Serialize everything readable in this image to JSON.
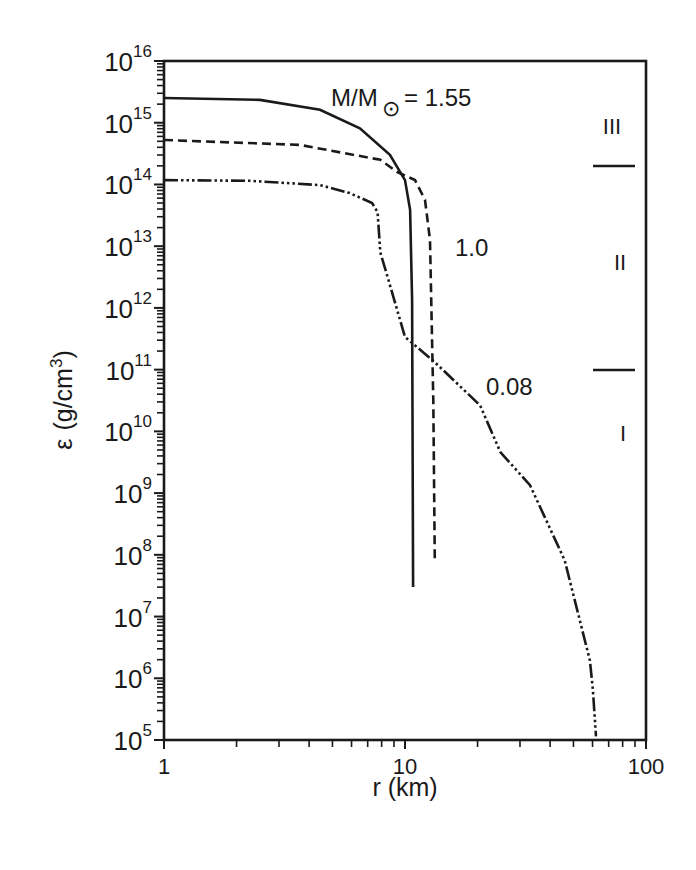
{
  "chart_data": {
    "type": "line",
    "title": "",
    "xlabel": "r (km)",
    "ylabel": "ε (g/cm3)",
    "xscale": "log",
    "yscale": "log",
    "xlim": [
      1,
      100
    ],
    "ylim": [
      100000.0,
      1e+16
    ],
    "x_ticks": [
      {
        "value": 1,
        "label": "1"
      },
      {
        "value": 10,
        "label": "10"
      },
      {
        "value": 100,
        "label": "100"
      }
    ],
    "y_ticks": [
      {
        "exp": 5,
        "base": "10",
        "label_exp": "5"
      },
      {
        "exp": 6,
        "base": "10",
        "label_exp": "6"
      },
      {
        "exp": 7,
        "base": "10",
        "label_exp": "7"
      },
      {
        "exp": 8,
        "base": "10",
        "label_exp": "8"
      },
      {
        "exp": 9,
        "base": "10",
        "label_exp": "9"
      },
      {
        "exp": 10,
        "base": "10",
        "label_exp": "10"
      },
      {
        "exp": 11,
        "base": "10",
        "label_exp": "11"
      },
      {
        "exp": 12,
        "base": "10",
        "label_exp": "12"
      },
      {
        "exp": 13,
        "base": "10",
        "label_exp": "13"
      },
      {
        "exp": 14,
        "base": "10",
        "label_exp": "14"
      },
      {
        "exp": 15,
        "base": "10",
        "label_exp": "15"
      },
      {
        "exp": 16,
        "base": "10",
        "label_exp": "16"
      }
    ],
    "grid": false,
    "legend": "none (curves labelled inline)",
    "series": [
      {
        "name": "M/M☉ = 1.55",
        "style": "solid",
        "points": [
          {
            "r": 1.0,
            "log_eps": 15.4
          },
          {
            "r": 2.5,
            "log_eps": 15.37
          },
          {
            "r": 4.44,
            "log_eps": 15.21
          },
          {
            "r": 6.5,
            "log_eps": 14.91
          },
          {
            "r": 8.66,
            "log_eps": 14.48
          },
          {
            "r": 10.0,
            "log_eps": 14.07
          },
          {
            "r": 10.5,
            "log_eps": 13.59
          },
          {
            "r": 10.7,
            "log_eps": 12.13
          },
          {
            "r": 10.8,
            "log_eps": 7.48
          }
        ]
      },
      {
        "name": "1.0",
        "style": "dashed",
        "points": [
          {
            "r": 1.0,
            "log_eps": 14.72
          },
          {
            "r": 3.66,
            "log_eps": 14.64
          },
          {
            "r": 7.9,
            "log_eps": 14.4
          },
          {
            "r": 9.3,
            "log_eps": 14.2
          },
          {
            "r": 11.0,
            "log_eps": 14.07
          },
          {
            "r": 12.1,
            "log_eps": 13.75
          },
          {
            "r": 12.7,
            "log_eps": 13.1
          },
          {
            "r": 13.1,
            "log_eps": 10.51
          },
          {
            "r": 13.3,
            "log_eps": 7.88
          }
        ]
      },
      {
        "name": "0.08",
        "style": "dash-dot-dot",
        "points": [
          {
            "r": 1.0,
            "log_eps": 14.07
          },
          {
            "r": 2.27,
            "log_eps": 14.06
          },
          {
            "r": 4.44,
            "log_eps": 13.99
          },
          {
            "r": 5.9,
            "log_eps": 13.86
          },
          {
            "r": 7.3,
            "log_eps": 13.7
          },
          {
            "r": 7.7,
            "log_eps": 13.55
          },
          {
            "r": 7.9,
            "log_eps": 12.9
          },
          {
            "r": 8.25,
            "log_eps": 12.65
          },
          {
            "r": 10.0,
            "log_eps": 11.53
          },
          {
            "r": 13.3,
            "log_eps": 11.12
          },
          {
            "r": 20.5,
            "log_eps": 10.42
          },
          {
            "r": 24.9,
            "log_eps": 9.66
          },
          {
            "r": 33.0,
            "log_eps": 9.13
          },
          {
            "r": 46.0,
            "log_eps": 7.91
          },
          {
            "r": 58.5,
            "log_eps": 6.29
          },
          {
            "r": 60.2,
            "log_eps": 5.81
          },
          {
            "r": 62.0,
            "log_eps": 5.06
          }
        ]
      }
    ],
    "annotations": [
      {
        "text": "M/M",
        "sub": "☉",
        "suffix": " = 1.55",
        "r": 2.9,
        "log_eps": 15.5
      },
      {
        "text": "1.0",
        "r": 14.5,
        "log_eps": 12.95
      },
      {
        "text": "0.08",
        "r": 23.0,
        "log_eps": 10.7
      },
      {
        "text": "III",
        "r": 76.5,
        "log_eps": 14.8,
        "role": "region-label"
      },
      {
        "text": "II",
        "r": 76.5,
        "log_eps": 12.6,
        "role": "region-label"
      },
      {
        "text": "I",
        "r": 76.5,
        "log_eps": 9.88,
        "role": "region-label"
      }
    ],
    "region_boundaries": [
      {
        "log_eps": 14.3,
        "label": "III/II boundary"
      },
      {
        "log_eps": 11.0,
        "label": "II/I boundary"
      }
    ]
  },
  "labels": {
    "xlabel": "r  (km)",
    "ylabel_eps": "ε",
    "ylabel_units": "(g/cm",
    "ylabel_exp": "3",
    "ylabel_close": ")",
    "annot_mass_main": "M/M",
    "annot_mass_sub": "⊙",
    "annot_mass_value": " = 1.55",
    "annot_1_0": "1.0",
    "annot_0_08": "0.08",
    "region_III": "III",
    "region_II": "II",
    "region_I": "I"
  },
  "colors": {
    "ink": "#1a1a1a",
    "background": "#ffffff"
  }
}
